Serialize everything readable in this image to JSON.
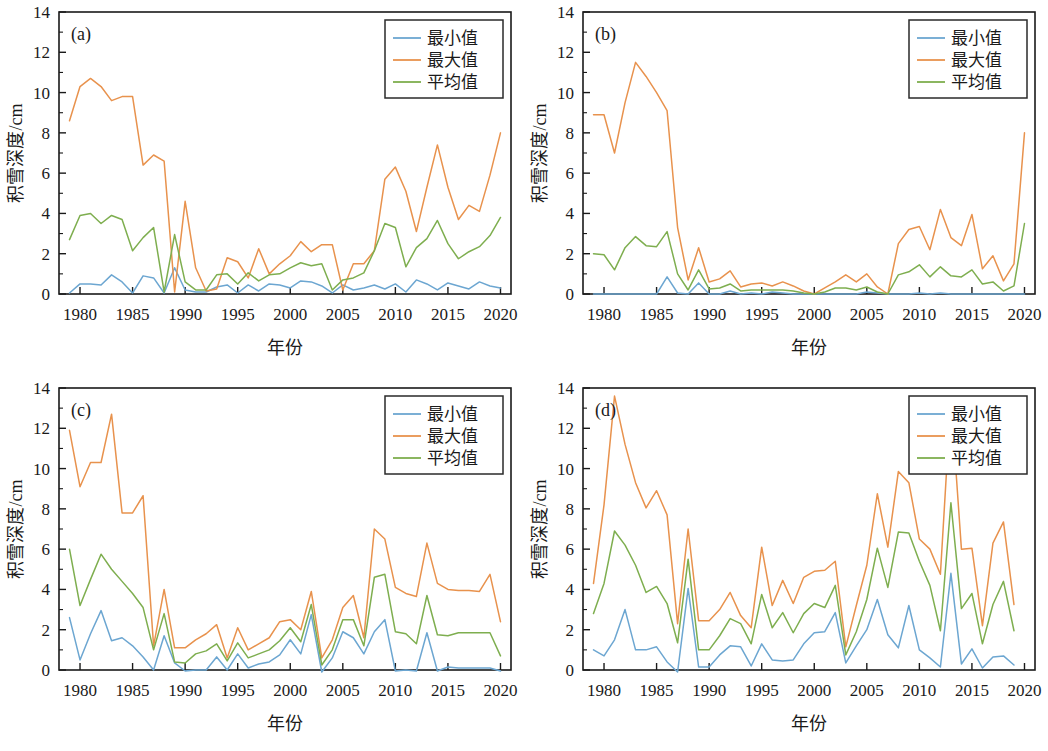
{
  "figure": {
    "panels": [
      "(a)",
      "(b)",
      "(c)",
      "(d)"
    ],
    "xlabel": "年份",
    "ylabel": "积雪深度/cm",
    "legend": [
      "最小值",
      "最大值",
      "平均值"
    ],
    "colors": {
      "min": "#6CA6D1",
      "max": "#E8924D",
      "mean": "#7EAE4F",
      "axis": "#1a1a1a",
      "background": "#ffffff"
    },
    "x_ticks": [
      "1980",
      "1985",
      "1990",
      "1995",
      "2000",
      "2005",
      "2010",
      "2015",
      "2020"
    ],
    "y_ticks": [
      "0",
      "2",
      "4",
      "6",
      "8",
      "10",
      "12",
      "14"
    ]
  },
  "chart_data": [
    {
      "type": "line",
      "panel": "(a)",
      "title": "(a)",
      "xlabel": "年份",
      "ylabel": "积雪深度/cm",
      "xlim": [
        1978,
        2021
      ],
      "ylim": [
        0,
        14
      ],
      "grid": false,
      "legend_position": "upper right",
      "x": [
        1979,
        1980,
        1981,
        1982,
        1983,
        1984,
        1985,
        1986,
        1987,
        1988,
        1989,
        1990,
        1991,
        1992,
        1993,
        1994,
        1995,
        1996,
        1997,
        1998,
        1999,
        2000,
        2001,
        2002,
        2003,
        2004,
        2005,
        2006,
        2007,
        2008,
        2009,
        2010,
        2011,
        2012,
        2013,
        2014,
        2015,
        2016,
        2017,
        2018,
        2019,
        2020
      ],
      "series": [
        {
          "name": "最小值",
          "color": "#6CA6D1",
          "values": [
            0.05,
            0.5,
            0.5,
            0.45,
            0.95,
            0.6,
            0.05,
            0.9,
            0.8,
            0.05,
            1.3,
            0.2,
            0.1,
            0.1,
            0.35,
            0.45,
            0.05,
            0.45,
            0.15,
            0.5,
            0.45,
            0.3,
            0.65,
            0.6,
            0.4,
            0.05,
            0.45,
            0.2,
            0.3,
            0.45,
            0.25,
            0.5,
            0.1,
            0.7,
            0.5,
            0.2,
            0.55,
            0.4,
            0.25,
            0.6,
            0.4,
            0.3
          ]
        },
        {
          "name": "最大值",
          "color": "#E8924D",
          "values": [
            8.6,
            10.3,
            10.7,
            10.3,
            9.6,
            9.8,
            9.8,
            6.4,
            6.9,
            6.6,
            0.1,
            4.6,
            1.3,
            0.15,
            0.25,
            1.8,
            1.6,
            0.8,
            2.25,
            1.0,
            1.5,
            1.9,
            2.6,
            2.1,
            2.45,
            2.45,
            0.2,
            1.5,
            1.5,
            2.15,
            5.7,
            6.3,
            5.1,
            3.1,
            5.3,
            7.4,
            5.3,
            3.7,
            4.4,
            4.1,
            5.9,
            8.0
          ]
        },
        {
          "name": "平均值",
          "color": "#7EAE4F",
          "values": [
            2.7,
            3.9,
            4.0,
            3.5,
            3.9,
            3.7,
            2.15,
            2.8,
            3.3,
            0.1,
            2.95,
            0.6,
            0.2,
            0.2,
            0.95,
            1.0,
            0.5,
            1.05,
            0.65,
            0.95,
            1.0,
            1.3,
            1.55,
            1.4,
            1.5,
            0.2,
            0.7,
            0.8,
            1.05,
            2.15,
            3.5,
            3.3,
            1.35,
            2.3,
            2.75,
            3.65,
            2.5,
            1.75,
            2.1,
            2.35,
            2.9,
            3.8
          ]
        }
      ]
    },
    {
      "type": "line",
      "panel": "(b)",
      "title": "(b)",
      "xlabel": "年份",
      "ylabel": "积雪深度/cm",
      "xlim": [
        1978,
        2021
      ],
      "ylim": [
        0,
        14
      ],
      "grid": false,
      "legend_position": "upper right",
      "x": [
        1979,
        1980,
        1981,
        1982,
        1983,
        1984,
        1985,
        1986,
        1987,
        1988,
        1989,
        1990,
        1991,
        1992,
        1993,
        1994,
        1995,
        1996,
        1997,
        1998,
        1999,
        2000,
        2001,
        2002,
        2003,
        2004,
        2005,
        2006,
        2007,
        2008,
        2009,
        2010,
        2011,
        2012,
        2013,
        2014,
        2015,
        2016,
        2017,
        2018,
        2019,
        2020
      ],
      "series": [
        {
          "name": "最小值",
          "color": "#6CA6D1",
          "values": [
            0.0,
            0.0,
            0.0,
            0.0,
            0.0,
            0.0,
            0.0,
            0.85,
            0.05,
            0.0,
            0.55,
            0.0,
            0.0,
            0.15,
            0.0,
            0.05,
            0.0,
            0.1,
            0.05,
            0.0,
            0.0,
            0.0,
            0.0,
            0.0,
            0.0,
            0.0,
            0.1,
            0.05,
            0.0,
            0.0,
            0.0,
            0.05,
            0.0,
            0.05,
            0.0,
            0.0,
            0.0,
            0.0,
            0.0,
            0.0,
            0.0,
            0.0
          ]
        },
        {
          "name": "最大值",
          "color": "#E8924D",
          "values": [
            8.9,
            8.9,
            7.0,
            9.5,
            11.5,
            10.8,
            10.0,
            9.1,
            3.3,
            0.7,
            2.3,
            0.6,
            0.75,
            1.15,
            0.35,
            0.5,
            0.55,
            0.4,
            0.6,
            0.4,
            0.15,
            0.0,
            0.3,
            0.6,
            0.95,
            0.6,
            1.0,
            0.35,
            0.0,
            2.5,
            3.2,
            3.35,
            2.2,
            4.2,
            2.8,
            2.4,
            3.95,
            1.25,
            1.9,
            0.65,
            1.5,
            8.0
          ]
        },
        {
          "name": "平均值",
          "color": "#7EAE4F",
          "values": [
            2.0,
            1.95,
            1.2,
            2.3,
            2.85,
            2.4,
            2.35,
            3.1,
            1.0,
            0.2,
            1.2,
            0.25,
            0.3,
            0.5,
            0.15,
            0.2,
            0.2,
            0.2,
            0.2,
            0.15,
            0.05,
            0.0,
            0.1,
            0.3,
            0.3,
            0.2,
            0.35,
            0.1,
            0.0,
            0.95,
            1.1,
            1.45,
            0.85,
            1.35,
            0.9,
            0.85,
            1.2,
            0.5,
            0.6,
            0.15,
            0.4,
            3.5
          ]
        }
      ]
    },
    {
      "type": "line",
      "panel": "(c)",
      "title": "(c)",
      "xlabel": "年份",
      "ylabel": "积雪深度/cm",
      "xlim": [
        1978,
        2021
      ],
      "ylim": [
        0,
        14
      ],
      "grid": false,
      "legend_position": "upper right",
      "x": [
        1979,
        1980,
        1981,
        1982,
        1983,
        1984,
        1985,
        1986,
        1987,
        1988,
        1989,
        1990,
        1991,
        1992,
        1993,
        1994,
        1995,
        1996,
        1997,
        1998,
        1999,
        2000,
        2001,
        2002,
        2003,
        2004,
        2005,
        2006,
        2007,
        2008,
        2009,
        2010,
        2011,
        2012,
        2013,
        2014,
        2015,
        2016,
        2017,
        2018,
        2019,
        2020
      ],
      "series": [
        {
          "name": "最小值",
          "color": "#6CA6D1",
          "values": [
            2.6,
            0.5,
            1.8,
            2.95,
            1.45,
            1.6,
            1.2,
            0.65,
            0.0,
            1.7,
            0.35,
            -0.05,
            0.0,
            0.0,
            0.65,
            0.0,
            0.8,
            0.1,
            0.3,
            0.4,
            0.75,
            1.5,
            0.8,
            2.75,
            -0.1,
            0.6,
            1.9,
            1.6,
            0.8,
            1.9,
            2.5,
            -0.05,
            0.0,
            -0.05,
            1.85,
            -0.05,
            0.15,
            0.1,
            0.1,
            0.1,
            0.1,
            -0.05
          ]
        },
        {
          "name": "最大值",
          "color": "#E8924D",
          "values": [
            11.9,
            9.1,
            10.3,
            10.3,
            12.7,
            7.8,
            7.8,
            8.65,
            1.2,
            4.0,
            1.1,
            1.1,
            1.5,
            1.8,
            2.25,
            0.6,
            2.1,
            1.0,
            1.3,
            1.6,
            2.4,
            2.5,
            2.0,
            3.9,
            0.6,
            1.5,
            3.1,
            3.7,
            1.6,
            7.0,
            6.5,
            4.1,
            3.8,
            3.65,
            6.3,
            4.3,
            4.0,
            3.95,
            3.95,
            3.9,
            4.75,
            2.4
          ]
        },
        {
          "name": "平均值",
          "color": "#7EAE4F",
          "values": [
            6.0,
            3.2,
            4.5,
            5.75,
            5.0,
            4.4,
            3.8,
            3.1,
            1.0,
            2.8,
            0.4,
            0.35,
            0.8,
            0.95,
            1.3,
            0.45,
            1.35,
            0.6,
            0.8,
            1.0,
            1.45,
            2.1,
            1.4,
            3.25,
            0.25,
            1.0,
            2.5,
            2.5,
            1.2,
            4.6,
            4.75,
            1.9,
            1.8,
            1.3,
            3.7,
            1.75,
            1.7,
            1.85,
            1.85,
            1.85,
            1.85,
            0.7
          ]
        }
      ]
    },
    {
      "type": "line",
      "panel": "(d)",
      "title": "(d)",
      "xlabel": "年份",
      "ylabel": "积雪深度/cm",
      "xlim": [
        1978,
        2021
      ],
      "ylim": [
        0,
        14
      ],
      "grid": false,
      "legend_position": "upper right",
      "x": [
        1979,
        1980,
        1981,
        1982,
        1983,
        1984,
        1985,
        1986,
        1987,
        1988,
        1989,
        1990,
        1991,
        1992,
        1993,
        1994,
        1995,
        1996,
        1997,
        1998,
        1999,
        2000,
        2001,
        2002,
        2003,
        2004,
        2005,
        2006,
        2007,
        2008,
        2009,
        2010,
        2011,
        2012,
        2013,
        2014,
        2015,
        2016,
        2017,
        2018,
        2019
      ],
      "series": [
        {
          "name": "最小值",
          "color": "#6CA6D1",
          "values": [
            1.0,
            0.7,
            1.5,
            3.0,
            1.0,
            1.0,
            1.15,
            0.4,
            -0.1,
            4.05,
            0.15,
            0.15,
            0.75,
            1.2,
            1.15,
            0.2,
            1.3,
            0.5,
            0.45,
            0.5,
            1.3,
            1.85,
            1.9,
            2.85,
            0.35,
            1.2,
            2.0,
            3.5,
            1.75,
            1.1,
            3.2,
            1.0,
            0.6,
            0.15,
            4.8,
            0.3,
            1.05,
            0.1,
            0.65,
            0.7,
            0.25
          ]
        },
        {
          "name": "最大值",
          "color": "#E8924D",
          "values": [
            4.3,
            8.2,
            13.6,
            11.2,
            9.3,
            8.05,
            8.9,
            7.7,
            2.3,
            7.0,
            2.45,
            2.45,
            3.0,
            3.85,
            2.7,
            2.1,
            6.1,
            3.2,
            4.45,
            3.3,
            4.6,
            4.9,
            4.95,
            5.4,
            1.15,
            3.2,
            5.2,
            8.75,
            6.1,
            9.85,
            9.3,
            6.5,
            6.0,
            4.75,
            13.5,
            6.0,
            6.05,
            2.2,
            6.3,
            7.35,
            3.25
          ]
        },
        {
          "name": "平均值",
          "color": "#7EAE4F",
          "values": [
            2.8,
            4.3,
            6.9,
            6.2,
            5.2,
            3.85,
            4.15,
            3.3,
            1.35,
            5.5,
            1.0,
            1.0,
            1.7,
            2.55,
            2.3,
            1.3,
            3.75,
            2.1,
            2.85,
            1.85,
            2.8,
            3.3,
            3.1,
            4.2,
            0.75,
            1.9,
            3.5,
            6.05,
            4.1,
            6.85,
            6.8,
            5.4,
            4.2,
            1.95,
            8.3,
            3.05,
            3.8,
            1.3,
            3.25,
            4.4,
            1.95
          ]
        }
      ]
    }
  ]
}
